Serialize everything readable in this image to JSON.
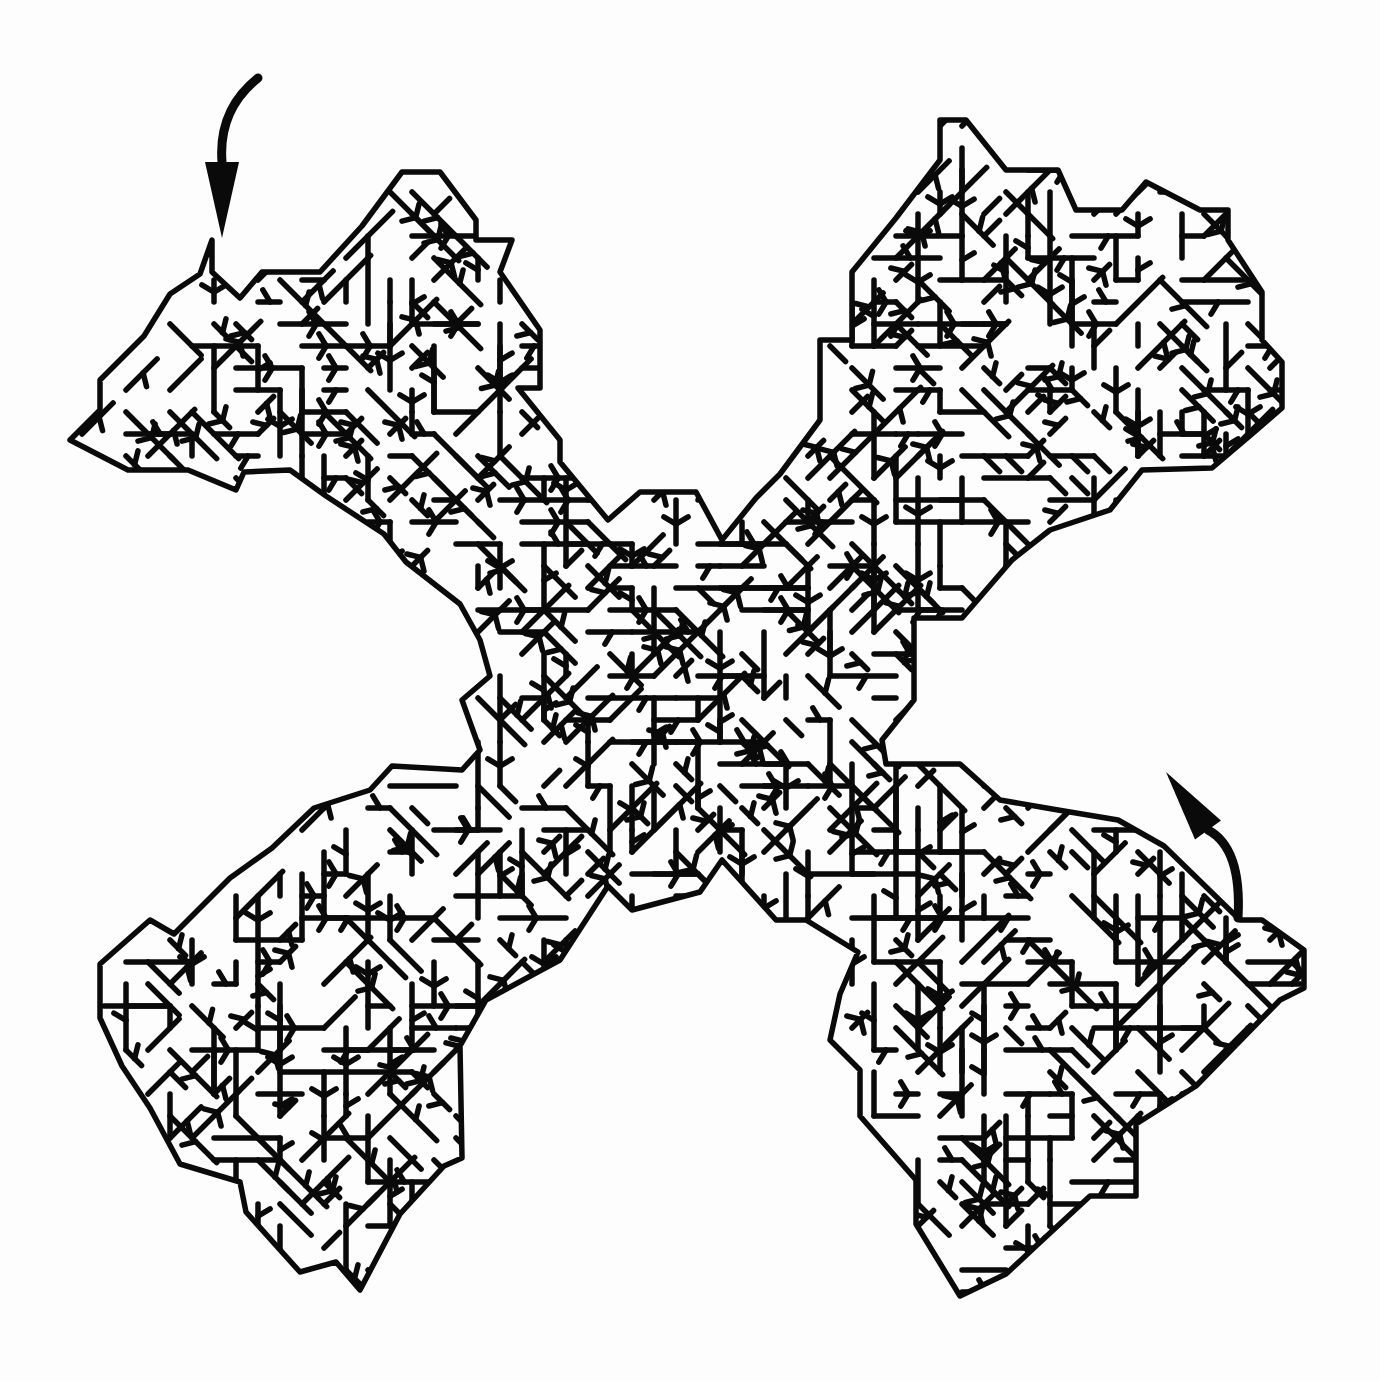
{
  "puzzle": {
    "type": "maze",
    "shape": "X",
    "title": "",
    "background": "#fdfdfd",
    "ink": "#0a0a0a",
    "wall_width": 5.5
  },
  "arrows": {
    "entrance": {
      "label": "start",
      "direction": "down",
      "tail": [
        258,
        78
      ],
      "ctrl": [
        218,
        110
      ],
      "neck": [
        222,
        162
      ],
      "tip": [
        222,
        238
      ],
      "head_half_width": 17
    },
    "exit": {
      "label": "finish",
      "direction": "up-left",
      "tail": [
        1238,
        918
      ],
      "ctrl": [
        1242,
        848
      ],
      "neck": [
        1208,
        830
      ],
      "tip": [
        1166,
        772
      ],
      "head_half_width": 16
    }
  },
  "outline": [
    [
      212,
      240
    ],
    [
      212,
      272
    ],
    [
      240,
      298
    ],
    [
      262,
      272
    ],
    [
      320,
      272
    ],
    [
      362,
      226
    ],
    [
      402,
      172
    ],
    [
      440,
      172
    ],
    [
      476,
      220
    ],
    [
      476,
      240
    ],
    [
      512,
      240
    ],
    [
      500,
      272
    ],
    [
      540,
      330
    ],
    [
      540,
      388
    ],
    [
      518,
      388
    ],
    [
      560,
      440
    ],
    [
      560,
      462
    ],
    [
      608,
      520
    ],
    [
      640,
      492
    ],
    [
      696,
      492
    ],
    [
      722,
      540
    ],
    [
      756,
      498
    ],
    [
      780,
      474
    ],
    [
      820,
      420
    ],
    [
      820,
      340
    ],
    [
      852,
      340
    ],
    [
      852,
      272
    ],
    [
      896,
      218
    ],
    [
      940,
      160
    ],
    [
      940,
      120
    ],
    [
      966,
      120
    ],
    [
      1006,
      170
    ],
    [
      1058,
      170
    ],
    [
      1076,
      210
    ],
    [
      1122,
      210
    ],
    [
      1146,
      182
    ],
    [
      1200,
      210
    ],
    [
      1228,
      210
    ],
    [
      1228,
      240
    ],
    [
      1262,
      292
    ],
    [
      1262,
      340
    ],
    [
      1282,
      362
    ],
    [
      1282,
      408
    ],
    [
      1252,
      434
    ],
    [
      1212,
      468
    ],
    [
      1142,
      470
    ],
    [
      1110,
      510
    ],
    [
      1050,
      530
    ],
    [
      1012,
      560
    ],
    [
      962,
      618
    ],
    [
      914,
      618
    ],
    [
      914,
      700
    ],
    [
      882,
      740
    ],
    [
      886,
      764
    ],
    [
      960,
      764
    ],
    [
      1000,
      800
    ],
    [
      1058,
      810
    ],
    [
      1118,
      820
    ],
    [
      1164,
      846
    ],
    [
      1240,
      920
    ],
    [
      1262,
      920
    ],
    [
      1304,
      950
    ],
    [
      1304,
      988
    ],
    [
      1280,
      1000
    ],
    [
      1196,
      1086
    ],
    [
      1136,
      1124
    ],
    [
      1136,
      1196
    ],
    [
      1090,
      1196
    ],
    [
      1036,
      1246
    ],
    [
      1006,
      1274
    ],
    [
      960,
      1296
    ],
    [
      916,
      1224
    ],
    [
      916,
      1180
    ],
    [
      860,
      1116
    ],
    [
      860,
      1070
    ],
    [
      830,
      1040
    ],
    [
      840,
      994
    ],
    [
      858,
      952
    ],
    [
      806,
      920
    ],
    [
      776,
      920
    ],
    [
      722,
      860
    ],
    [
      700,
      892
    ],
    [
      632,
      910
    ],
    [
      608,
      886
    ],
    [
      560,
      960
    ],
    [
      486,
      1000
    ],
    [
      460,
      1046
    ],
    [
      462,
      1158
    ],
    [
      444,
      1166
    ],
    [
      400,
      1214
    ],
    [
      360,
      1290
    ],
    [
      336,
      1262
    ],
    [
      300,
      1272
    ],
    [
      246,
      1212
    ],
    [
      240,
      1182
    ],
    [
      180,
      1164
    ],
    [
      150,
      1108
    ],
    [
      122,
      1066
    ],
    [
      100,
      1018
    ],
    [
      100,
      964
    ],
    [
      150,
      920
    ],
    [
      174,
      934
    ],
    [
      230,
      878
    ],
    [
      272,
      848
    ],
    [
      314,
      808
    ],
    [
      370,
      790
    ],
    [
      392,
      766
    ],
    [
      462,
      770
    ],
    [
      480,
      750
    ],
    [
      462,
      700
    ],
    [
      490,
      676
    ],
    [
      480,
      640
    ],
    [
      460,
      604
    ],
    [
      406,
      562
    ],
    [
      384,
      534
    ],
    [
      326,
      496
    ],
    [
      290,
      470
    ],
    [
      244,
      472
    ],
    [
      236,
      490
    ],
    [
      188,
      470
    ],
    [
      128,
      470
    ],
    [
      70,
      440
    ],
    [
      100,
      410
    ],
    [
      100,
      380
    ],
    [
      144,
      336
    ],
    [
      170,
      294
    ],
    [
      200,
      274
    ],
    [
      212,
      240
    ]
  ],
  "generator": {
    "seed": 7,
    "cell": 22,
    "branch_density": 0.62
  }
}
